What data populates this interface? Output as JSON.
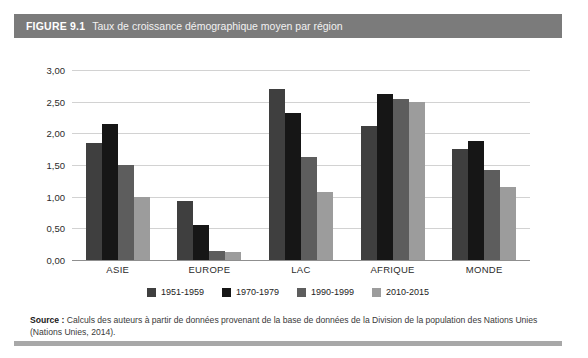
{
  "figure": {
    "number": "FIGURE 9.1",
    "title": "Taux de croissance démographique moyen par région"
  },
  "source": {
    "label": "Source :",
    "text": " Calculs des auteurs à partir de données provenant de la base de données de la Division de la population des Nations Unies (Nations Unies, 2014)."
  },
  "colors": {
    "series1": "#3f3f3f",
    "series2": "#161616",
    "series3": "#5d5d5d",
    "series4": "#9c9c9c",
    "header_bar": "#7b7b7b",
    "gridline": "#d2d2d2",
    "axis": "#8f8f8f"
  },
  "chart_data": {
    "type": "bar",
    "title": "Taux de croissance démographique moyen par région",
    "xlabel": "",
    "ylabel": "",
    "ylim": [
      0,
      3.0
    ],
    "ytick_labels": [
      "0,00",
      "0,50",
      "1,00",
      "1,50",
      "2,00",
      "2,50",
      "3,00"
    ],
    "ytick_values": [
      0,
      0.5,
      1.0,
      1.5,
      2.0,
      2.5,
      3.0
    ],
    "grid": true,
    "legend_position": "bottom",
    "categories": [
      "ASIE",
      "EUROPE",
      "LAC",
      "AFRIQUE",
      "MONDE"
    ],
    "series": [
      {
        "name": "1951-1959",
        "color": "#3f3f3f",
        "values": [
          1.85,
          0.93,
          2.7,
          2.12,
          1.75
        ]
      },
      {
        "name": "1970-1979",
        "color": "#161616",
        "values": [
          2.15,
          0.55,
          2.32,
          2.62,
          1.88
        ]
      },
      {
        "name": "1990-1999",
        "color": "#5d5d5d",
        "values": [
          1.5,
          0.15,
          1.62,
          2.55,
          1.42
        ]
      },
      {
        "name": "2010-2015",
        "color": "#9c9c9c",
        "values": [
          1.0,
          0.13,
          1.08,
          2.5,
          1.15
        ]
      }
    ]
  }
}
